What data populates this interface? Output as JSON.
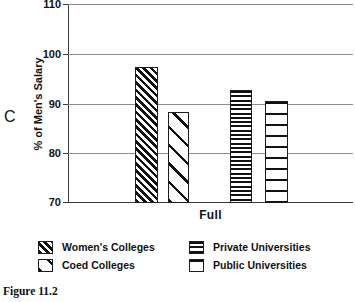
{
  "panel": {
    "letter": "C"
  },
  "caption": {
    "text": "Figure 11.2"
  },
  "chart_data": {
    "type": "bar",
    "title": "",
    "subtitle": "",
    "xlabel": "Full",
    "ylabel": "% of Men's Salary",
    "ylim": [
      70,
      110
    ],
    "yticks": [
      70,
      80,
      90,
      100,
      110
    ],
    "ytick_labels": [
      "70",
      "80",
      "90",
      "100",
      "110"
    ],
    "grid": true,
    "grid_axis": "y",
    "legend_position": "bottom",
    "categories": [
      "Full"
    ],
    "series": [
      {
        "name": "Women's Colleges",
        "pattern": "diagonal-dense",
        "values": [
          97.3
        ]
      },
      {
        "name": "Coed Colleges",
        "pattern": "diagonal-sparse",
        "values": [
          88.3
        ]
      },
      {
        "name": "Private Universities",
        "pattern": "horizontal-dense",
        "values": [
          92.7
        ]
      },
      {
        "name": "Public Universities",
        "pattern": "horizontal-sparse",
        "values": [
          90.5
        ]
      }
    ],
    "legend": [
      "Women's Colleges",
      "Coed Colleges",
      "Private Universities",
      "Public Universities"
    ],
    "colors": {
      "ink": "#111111",
      "gridline": "#8d8d8d",
      "axis": "#3a3a3a",
      "background": "#ffffff"
    }
  }
}
